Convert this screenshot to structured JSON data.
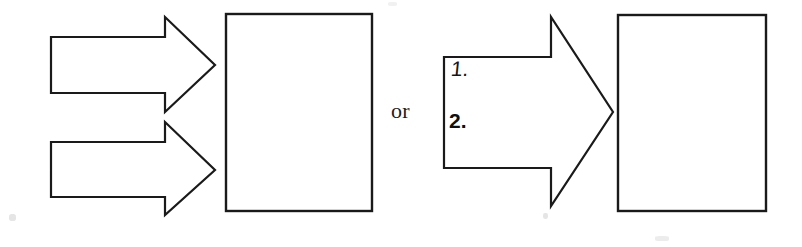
{
  "figure": {
    "background_color": "#ffffff",
    "line_color": "#1a1a1a",
    "connector_label": "or",
    "left_variant": {
      "name": "two-separate-arrows",
      "arrows": [
        {
          "id": "arrow-top",
          "label": "",
          "direction": "right"
        },
        {
          "id": "arrow-bottom",
          "label": "",
          "direction": "right"
        }
      ],
      "target_box": {
        "id": "box-left",
        "label": ""
      }
    },
    "right_variant": {
      "name": "single-combined-arrow",
      "arrow": {
        "id": "arrow-combined",
        "direction": "right",
        "items": [
          {
            "marker": "1."
          },
          {
            "marker": "2."
          }
        ]
      },
      "target_box": {
        "id": "box-right",
        "label": ""
      }
    }
  }
}
